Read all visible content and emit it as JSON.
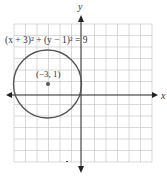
{
  "equation_label": "(x + 3)² + (y − 1)² = 9",
  "center_label": "(−3, 1)",
  "axis_labels": {
    "x": "x",
    "y": "y"
  },
  "grid": {
    "xmin": -6,
    "xmax": 6,
    "ymin": -6,
    "ymax": 6,
    "step": 1
  },
  "circle": {
    "center": [
      -3,
      1
    ],
    "radius": 3
  },
  "colors": {
    "grid": "#c8c8c8",
    "axis": "#222222",
    "circle": "#555555",
    "point": "#555555"
  }
}
